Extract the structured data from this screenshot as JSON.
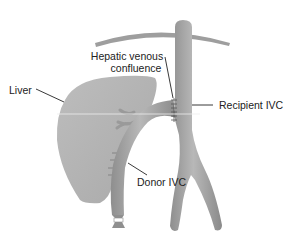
{
  "diagram": {
    "labels": {
      "hepatic_line1": "Hepatic venous",
      "hepatic_line2": "confluence",
      "liver": "Liver",
      "recipient_ivc": "Recipient IVC",
      "donor_ivc": "Donor IVC"
    },
    "colors": {
      "background": "#ffffff",
      "liver_fill": "#b4b4b4",
      "vessel_fill": "#a8a8a8",
      "vessel_dark": "#8c8c8c",
      "vessel_light": "#c4c4c4",
      "diaphragm": "#9a9a9a",
      "leader_line": "#222222",
      "text": "#222222",
      "suture": "#555555",
      "ligature": "#ffffff"
    }
  }
}
